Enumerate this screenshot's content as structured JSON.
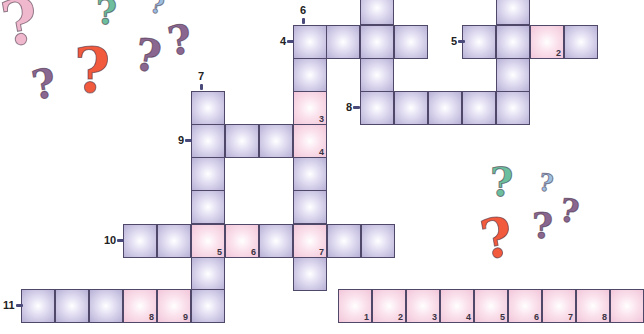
{
  "puzzle": {
    "type": "crossword",
    "cell_colors": {
      "normal": "#b7b0d6",
      "highlight": "#f2c6d9",
      "border": "#4f4868"
    },
    "clue_numbers": [
      {
        "n": "4",
        "dir": "across",
        "x": 280,
        "y": 35
      },
      {
        "n": "5",
        "dir": "across",
        "x": 451,
        "y": 35
      },
      {
        "n": "6",
        "dir": "down",
        "x": 303,
        "y": 8
      },
      {
        "n": "7",
        "dir": "down",
        "x": 201,
        "y": 74
      },
      {
        "n": "8",
        "dir": "across",
        "x": 346,
        "y": 101
      },
      {
        "n": "9",
        "dir": "across",
        "x": 178,
        "y": 134
      },
      {
        "n": "10",
        "dir": "across",
        "x": 104,
        "y": 234
      },
      {
        "n": "11",
        "dir": "across",
        "x": 3,
        "y": 299
      }
    ],
    "cells": [
      {
        "x": 360,
        "y": -9
      },
      {
        "x": 293,
        "y": 25
      },
      {
        "x": 326,
        "y": 25
      },
      {
        "x": 360,
        "y": 25
      },
      {
        "x": 394,
        "y": 25
      },
      {
        "x": 293,
        "y": 58
      },
      {
        "x": 360,
        "y": 58
      },
      {
        "x": 293,
        "y": 91,
        "pink": true,
        "num": "3"
      },
      {
        "x": 360,
        "y": 91
      },
      {
        "x": 394,
        "y": 91
      },
      {
        "x": 428,
        "y": 91
      },
      {
        "x": 462,
        "y": 91
      },
      {
        "x": 496,
        "y": 91
      },
      {
        "x": 496,
        "y": -9
      },
      {
        "x": 496,
        "y": 58
      },
      {
        "x": 462,
        "y": 25
      },
      {
        "x": 496,
        "y": 25
      },
      {
        "x": 530,
        "y": 25,
        "pink": true,
        "num": "2"
      },
      {
        "x": 564,
        "y": 25
      },
      {
        "x": 191,
        "y": 91
      },
      {
        "x": 191,
        "y": 124
      },
      {
        "x": 225,
        "y": 124
      },
      {
        "x": 259,
        "y": 124
      },
      {
        "x": 293,
        "y": 124,
        "pink": true,
        "num": "4"
      },
      {
        "x": 191,
        "y": 157
      },
      {
        "x": 293,
        "y": 157
      },
      {
        "x": 191,
        "y": 190
      },
      {
        "x": 293,
        "y": 190
      },
      {
        "x": 123,
        "y": 224
      },
      {
        "x": 157,
        "y": 224
      },
      {
        "x": 191,
        "y": 224,
        "pink": true,
        "num": "5"
      },
      {
        "x": 225,
        "y": 224,
        "pink": true,
        "num": "6"
      },
      {
        "x": 259,
        "y": 224
      },
      {
        "x": 293,
        "y": 224,
        "pink": true,
        "num": "7"
      },
      {
        "x": 327,
        "y": 224
      },
      {
        "x": 361,
        "y": 224
      },
      {
        "x": 191,
        "y": 257
      },
      {
        "x": 293,
        "y": 257
      },
      {
        "x": 21,
        "y": 289
      },
      {
        "x": 55,
        "y": 289
      },
      {
        "x": 89,
        "y": 289
      },
      {
        "x": 123,
        "y": 289,
        "pink": true,
        "num": "8"
      },
      {
        "x": 157,
        "y": 289,
        "pink": true,
        "num": "9"
      },
      {
        "x": 191,
        "y": 289
      }
    ],
    "answer_strip": {
      "x": 338,
      "y": 289,
      "numbers": [
        "1",
        "2",
        "3",
        "4",
        "5",
        "6",
        "7",
        "8",
        ""
      ]
    }
  },
  "decorations": {
    "question_marks": [
      {
        "x": 2,
        "y": -14,
        "size": 62,
        "color": "#f0b8cc"
      },
      {
        "x": 96,
        "y": -10,
        "size": 36,
        "color": "#6cbf9e"
      },
      {
        "x": 150,
        "y": -10,
        "size": 24,
        "color": "#9cc0e4"
      },
      {
        "x": 32,
        "y": 60,
        "size": 40,
        "color": "#8a6790"
      },
      {
        "x": 74,
        "y": 34,
        "size": 62,
        "color": "#f25a3e"
      },
      {
        "x": 135,
        "y": 30,
        "size": 44,
        "color": "#8a6790"
      },
      {
        "x": 168,
        "y": 16,
        "size": 40,
        "color": "#8a6790"
      },
      {
        "x": 490,
        "y": 158,
        "size": 40,
        "color": "#6cbf9e"
      },
      {
        "x": 539,
        "y": 168,
        "size": 24,
        "color": "#9cc0e4"
      },
      {
        "x": 481,
        "y": 206,
        "size": 54,
        "color": "#f25a3e"
      },
      {
        "x": 532,
        "y": 204,
        "size": 36,
        "color": "#8a6790"
      },
      {
        "x": 560,
        "y": 192,
        "size": 32,
        "color": "#8a6790"
      }
    ]
  }
}
